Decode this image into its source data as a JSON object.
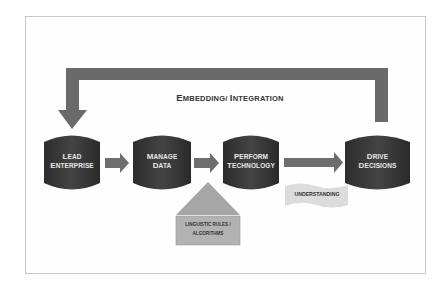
{
  "diagram": {
    "title": {
      "first_cap": "E",
      "first_rest": "MBEDDING/ ",
      "second_cap": "I",
      "second_rest": "NTEGRATION",
      "full": "EMBEDDING/ INTEGRATION"
    },
    "nodes": [
      {
        "id": "lead",
        "line1_cap": "L",
        "line1_rest": "EAD",
        "line2_cap": "E",
        "line2_rest": "NTERPRISE",
        "full": "LEAD ENTERPRISE",
        "shape": "cylinder"
      },
      {
        "id": "manage",
        "line1_cap": "M",
        "line1_rest": "ANAGE",
        "line2_cap": "D",
        "line2_rest": "ATA",
        "full": "MANAGE DATA",
        "shape": "cylinder"
      },
      {
        "id": "perform",
        "line1_cap": "P",
        "line1_rest": "ERFORM",
        "line2_cap": "T",
        "line2_rest": "ECHNOLOGY",
        "full": "PERFORM TECHNOLOGY",
        "shape": "cylinder"
      },
      {
        "id": "drive",
        "line1_cap": "D",
        "line1_rest": "RIVE",
        "line2_cap": "D",
        "line2_rest": "ECISIONS",
        "full": "DRIVE DECISIONS",
        "shape": "cylinder"
      }
    ],
    "support": {
      "house_line1": "LINGUISTIC RULES /",
      "house_line2": "ALGORITHMS",
      "banner": "UNDERSTANDING"
    },
    "edges": [
      {
        "from": "lead",
        "to": "manage"
      },
      {
        "from": "manage",
        "to": "perform"
      },
      {
        "from": "perform",
        "to": "drive"
      },
      {
        "from": "drive",
        "to": "lead",
        "label": "EMBEDDING/ INTEGRATION",
        "route": "over-top"
      }
    ],
    "colors": {
      "cylinder": "#3a3a3a",
      "arrow": "#6e6e6e",
      "house_roof": "#a8a8a8",
      "house_box": "#b4b4b4",
      "banner": "#dadada",
      "frame": "#c8c8c8"
    }
  }
}
